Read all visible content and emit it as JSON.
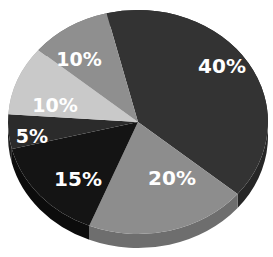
{
  "chart_data": {
    "type": "pie",
    "title": "",
    "values": [
      40,
      20,
      15,
      5,
      10,
      10
    ],
    "categories": [
      "Slice A",
      "Slice B",
      "Slice C",
      "Slice D",
      "Slice E",
      "Slice F"
    ],
    "labels": [
      "40%",
      "20%",
      "15%",
      "5%",
      "10%",
      "10%"
    ],
    "colors": [
      "#333333",
      "#8d8d8d",
      "#141414",
      "#2b2b2b",
      "#c9c9c9",
      "#8f8f8f"
    ],
    "start_angle_deg": -104,
    "direction": "clockwise",
    "legend": "none",
    "style": "3d-tilted grayscale"
  },
  "slices": [
    {
      "label": "40%",
      "value": 40,
      "color": "#333333",
      "side": "#262626"
    },
    {
      "label": "20%",
      "value": 20,
      "color": "#8d8d8d",
      "side": "#6e6e6e"
    },
    {
      "label": "15%",
      "value": 15,
      "color": "#141414",
      "side": "#0c0c0c"
    },
    {
      "label": "5%",
      "value": 5,
      "color": "#2b2b2b",
      "side": "#1e1e1e"
    },
    {
      "label": "10%",
      "value": 10,
      "color": "#c9c9c9",
      "side": "#a8a8a8"
    },
    {
      "label": "10%",
      "value": 10,
      "color": "#8f8f8f",
      "side": "#727272"
    }
  ]
}
